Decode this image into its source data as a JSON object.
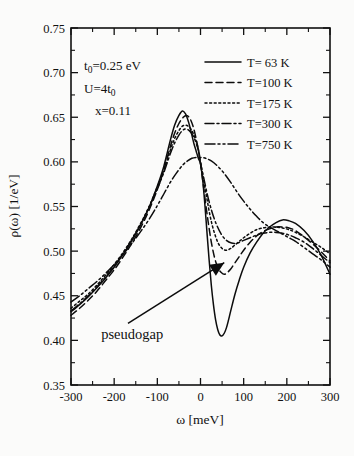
{
  "chart_data": {
    "type": "line",
    "title": "",
    "xlabel": "ω [meV]",
    "ylabel": "ρ(ω) [1/eV]",
    "xlim": [
      -300,
      300
    ],
    "ylim": [
      0.35,
      0.75
    ],
    "xticks": [
      -300,
      -200,
      -100,
      0,
      100,
      200,
      300
    ],
    "xtick_labels": [
      "-300",
      "-200",
      "-100",
      "0",
      "100",
      "200",
      "300"
    ],
    "xticks_minor": [
      -250,
      -150,
      -50,
      50,
      150,
      250
    ],
    "yticks": [
      0.35,
      0.4,
      0.45,
      0.5,
      0.55,
      0.6,
      0.65,
      0.7,
      0.75
    ],
    "ytick_labels": [
      "0.35",
      "0.40",
      "0.45",
      "0.50",
      "0.55",
      "0.60",
      "0.65",
      "0.70",
      "0.75"
    ],
    "yticks_minor": [
      0.375,
      0.425,
      0.475,
      0.525,
      0.575,
      0.625,
      0.675,
      0.725
    ],
    "grid": false,
    "legend_position": "top-right",
    "line_color": "#0c0c0c",
    "series": [
      {
        "name": "T=  63 K",
        "temperature_K": 63,
        "style": "solid",
        "dasharray": "",
        "x": [
          -300,
          -280,
          -260,
          -240,
          -220,
          -200,
          -180,
          -160,
          -140,
          -120,
          -100,
          -85,
          -70,
          -60,
          -50,
          -42,
          -35,
          -30,
          -25,
          -20,
          -15,
          -10,
          -5,
          0,
          5,
          10,
          15,
          20,
          25,
          30,
          35,
          40,
          45,
          50,
          55,
          60,
          65,
          70,
          80,
          90,
          100,
          115,
          130,
          145,
          160,
          175,
          190,
          205,
          220,
          240,
          260,
          280,
          300
        ],
        "y": [
          0.432,
          0.44,
          0.449,
          0.459,
          0.47,
          0.482,
          0.496,
          0.511,
          0.528,
          0.548,
          0.573,
          0.595,
          0.624,
          0.641,
          0.652,
          0.657,
          0.654,
          0.648,
          0.64,
          0.63,
          0.62,
          0.612,
          0.604,
          0.598,
          0.58,
          0.553,
          0.521,
          0.49,
          0.462,
          0.44,
          0.423,
          0.412,
          0.406,
          0.405,
          0.408,
          0.414,
          0.423,
          0.433,
          0.452,
          0.468,
          0.482,
          0.498,
          0.51,
          0.52,
          0.527,
          0.532,
          0.535,
          0.534,
          0.531,
          0.523,
          0.511,
          0.495,
          0.474
        ]
      },
      {
        "name": "T=100 K",
        "temperature_K": 100,
        "style": "dashed",
        "dasharray": "7,4",
        "x": [
          -300,
          -280,
          -260,
          -240,
          -220,
          -200,
          -180,
          -160,
          -140,
          -120,
          -100,
          -85,
          -70,
          -60,
          -50,
          -40,
          -32,
          -25,
          -18,
          -12,
          -6,
          0,
          6,
          12,
          18,
          24,
          30,
          36,
          42,
          48,
          55,
          62,
          70,
          80,
          90,
          100,
          115,
          130,
          145,
          160,
          175,
          190,
          205,
          220,
          240,
          260,
          280,
          300
        ],
        "y": [
          0.428,
          0.436,
          0.445,
          0.455,
          0.467,
          0.479,
          0.493,
          0.508,
          0.525,
          0.545,
          0.569,
          0.591,
          0.617,
          0.632,
          0.643,
          0.65,
          0.652,
          0.649,
          0.641,
          0.63,
          0.616,
          0.598,
          0.576,
          0.553,
          0.532,
          0.513,
          0.498,
          0.487,
          0.48,
          0.476,
          0.474,
          0.476,
          0.48,
          0.487,
          0.494,
          0.501,
          0.51,
          0.517,
          0.522,
          0.525,
          0.527,
          0.527,
          0.526,
          0.523,
          0.516,
          0.508,
          0.499,
          0.489
        ]
      },
      {
        "name": "T=175 K",
        "temperature_K": 175,
        "style": "dotted",
        "dasharray": "2,2.6",
        "x": [
          -300,
          -280,
          -260,
          -240,
          -220,
          -200,
          -180,
          -160,
          -140,
          -120,
          -100,
          -85,
          -70,
          -60,
          -50,
          -42,
          -34,
          -26,
          -18,
          -10,
          -4,
          0,
          6,
          14,
          22,
          30,
          40,
          50,
          60,
          70,
          80,
          90,
          100,
          115,
          130,
          145,
          160,
          175,
          190,
          205,
          220,
          240,
          260,
          280,
          300
        ],
        "y": [
          0.436,
          0.444,
          0.452,
          0.462,
          0.473,
          0.485,
          0.498,
          0.513,
          0.53,
          0.549,
          0.572,
          0.591,
          0.613,
          0.626,
          0.635,
          0.64,
          0.641,
          0.639,
          0.633,
          0.623,
          0.612,
          0.6,
          0.583,
          0.561,
          0.54,
          0.524,
          0.51,
          0.503,
          0.501,
          0.503,
          0.507,
          0.511,
          0.515,
          0.52,
          0.524,
          0.526,
          0.527,
          0.527,
          0.526,
          0.524,
          0.521,
          0.516,
          0.51,
          0.504,
          0.497
        ]
      },
      {
        "name": "T=300 K",
        "temperature_K": 300,
        "style": "dash-dot",
        "dasharray": "9,3,2,3",
        "x": [
          -300,
          -280,
          -260,
          -240,
          -220,
          -200,
          -180,
          -160,
          -140,
          -120,
          -100,
          -85,
          -70,
          -60,
          -50,
          -42,
          -34,
          -26,
          -18,
          -10,
          -4,
          0,
          8,
          16,
          26,
          36,
          48,
          60,
          72,
          85,
          100,
          115,
          130,
          145,
          160,
          175,
          190,
          205,
          220,
          240,
          260,
          280,
          300
        ],
        "y": [
          0.433,
          0.441,
          0.45,
          0.46,
          0.471,
          0.483,
          0.497,
          0.512,
          0.529,
          0.548,
          0.57,
          0.588,
          0.609,
          0.621,
          0.63,
          0.635,
          0.637,
          0.635,
          0.63,
          0.621,
          0.611,
          0.599,
          0.581,
          0.563,
          0.545,
          0.531,
          0.519,
          0.512,
          0.509,
          0.509,
          0.512,
          0.515,
          0.518,
          0.52,
          0.521,
          0.521,
          0.52,
          0.518,
          0.515,
          0.51,
          0.503,
          0.495,
          0.487
        ]
      },
      {
        "name": "T=750 K",
        "temperature_K": 750,
        "style": "dash-dot-dot",
        "dasharray": "10,3,2,3,2,3",
        "x": [
          -300,
          -280,
          -260,
          -240,
          -220,
          -200,
          -180,
          -160,
          -140,
          -120,
          -100,
          -85,
          -70,
          -55,
          -40,
          -30,
          -20,
          -10,
          0,
          12,
          25,
          40,
          55,
          70,
          85,
          100,
          115,
          130,
          145,
          160,
          175,
          190,
          205,
          220,
          240,
          260,
          280,
          300
        ],
        "y": [
          0.443,
          0.45,
          0.458,
          0.466,
          0.475,
          0.485,
          0.496,
          0.508,
          0.521,
          0.535,
          0.551,
          0.564,
          0.577,
          0.588,
          0.597,
          0.601,
          0.604,
          0.605,
          0.605,
          0.604,
          0.601,
          0.595,
          0.587,
          0.577,
          0.566,
          0.556,
          0.547,
          0.539,
          0.532,
          0.527,
          0.523,
          0.519,
          0.515,
          0.511,
          0.504,
          0.497,
          0.49,
          0.482
        ]
      }
    ],
    "annotations": [
      {
        "name": "pseudogap",
        "text": "pseudogap",
        "text_x": -230,
        "text_y": 0.402,
        "arrow_from_x": -168,
        "arrow_from_y": 0.419,
        "arrow_to_x": 55,
        "arrow_to_y": 0.487
      }
    ],
    "parameter_box": {
      "lines": [
        {
          "main": "t",
          "sub": "0",
          "rest": "=0.25 eV"
        },
        {
          "main": "U=4t",
          "sub": "0",
          "rest": ""
        },
        {
          "main": "x=0.11",
          "sub": "",
          "rest": ""
        }
      ],
      "line_texts": [
        "t₀=0.25 eV",
        "U=4t₀",
        "x=0.11"
      ]
    }
  },
  "axes": {
    "x_title": "ω [meV]",
    "y_title": "ρ(ω) [1/eV]"
  },
  "legend": {
    "entries": [
      {
        "label": "T=  63 K",
        "style": "solid"
      },
      {
        "label": "T=100 K",
        "style": "dashed"
      },
      {
        "label": "T=175 K",
        "style": "dotted"
      },
      {
        "label": "T=300 K",
        "style": "dash-dot"
      },
      {
        "label": "T=750 K",
        "style": "dash-dot-dot"
      }
    ]
  },
  "params": {
    "line1_main": "t",
    "line1_sub": "0",
    "line1_rest": "=0.25 eV",
    "line2_main": "U=4t",
    "line2_sub": "0",
    "line3": "x=0.11"
  },
  "annotation": {
    "pseudogap_label": "pseudogap"
  },
  "tick_labels": {
    "x": [
      "-300",
      "-200",
      "-100",
      "0",
      "100",
      "200",
      "300"
    ],
    "y": [
      "0.75",
      "0.70",
      "0.65",
      "0.60",
      "0.55",
      "0.50",
      "0.45",
      "0.40",
      "0.35"
    ]
  }
}
